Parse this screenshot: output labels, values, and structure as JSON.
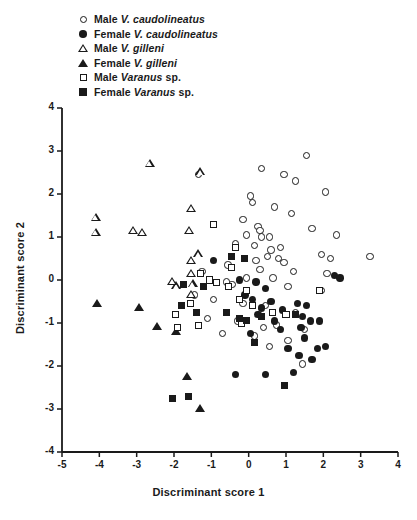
{
  "chart_data": {
    "type": "scatter",
    "title": "",
    "xlabel": "Discriminant score 1",
    "ylabel": "Discriminant score 2",
    "xlim": [
      -5,
      4
    ],
    "ylim": [
      -4,
      4
    ],
    "xticks": [
      "-5",
      "-4",
      "-3",
      "-2",
      "-1",
      "0",
      "1",
      "2",
      "3",
      "4"
    ],
    "xtick_values": [
      -5,
      -4,
      -3,
      -2,
      -1,
      0,
      1,
      2,
      3,
      4
    ],
    "yticks": [
      "4",
      "3",
      "2",
      "1",
      "0",
      "-1",
      "-2",
      "-3",
      "-4"
    ],
    "ytick_values": [
      4,
      3,
      2,
      1,
      0,
      -1,
      -2,
      -3,
      -4
    ],
    "grid": false,
    "legend_position": "top",
    "legend": [
      {
        "marker": "circle-open",
        "label": "Male ",
        "italic": "V. caudolineatus",
        "tail": ""
      },
      {
        "marker": "circle-filled",
        "label": "Female ",
        "italic": "V. caudolineatus",
        "tail": ""
      },
      {
        "marker": "triangle-open",
        "label": "Male ",
        "italic": "V. gilleni",
        "tail": ""
      },
      {
        "marker": "triangle-filled",
        "label": "Female ",
        "italic": "V. gilleni",
        "tail": ""
      },
      {
        "marker": "square-open",
        "label": "Male ",
        "italic": "Varanus",
        "tail": " sp."
      },
      {
        "marker": "square-filled",
        "label": "Female ",
        "italic": "Varanus",
        "tail": " sp."
      }
    ],
    "series": [
      {
        "name": "Male V. caudolineatus",
        "marker": "circle-open",
        "points": [
          [
            -1.35,
            2.45
          ],
          [
            0.35,
            2.6
          ],
          [
            0.95,
            2.45
          ],
          [
            1.55,
            2.9
          ],
          [
            1.25,
            2.3
          ],
          [
            2.05,
            2.05
          ],
          [
            0.05,
            1.95
          ],
          [
            0.1,
            1.8
          ],
          [
            0.7,
            1.7
          ],
          [
            1.15,
            1.55
          ],
          [
            -0.15,
            1.4
          ],
          [
            0.25,
            1.25
          ],
          [
            0.3,
            1.15
          ],
          [
            -0.05,
            1.05
          ],
          [
            0.35,
            1.0
          ],
          [
            0.55,
            1.0
          ],
          [
            1.7,
            1.2
          ],
          [
            2.35,
            1.05
          ],
          [
            -0.35,
            0.85
          ],
          [
            0.15,
            0.8
          ],
          [
            0.6,
            0.7
          ],
          [
            0.85,
            0.75
          ],
          [
            0.5,
            0.55
          ],
          [
            0.8,
            0.5
          ],
          [
            1.95,
            0.6
          ],
          [
            2.2,
            0.5
          ],
          [
            0.2,
            0.45
          ],
          [
            0.95,
            0.4
          ],
          [
            3.25,
            0.55
          ],
          [
            -0.55,
            0.35
          ],
          [
            0.3,
            0.25
          ],
          [
            1.2,
            0.2
          ],
          [
            2.1,
            0.15
          ],
          [
            -1.25,
            0.2
          ],
          [
            -0.05,
            0.05
          ],
          [
            0.65,
            0.05
          ],
          [
            -0.45,
            -0.1
          ],
          [
            1.05,
            -0.15
          ],
          [
            1.95,
            -0.25
          ],
          [
            -1.45,
            -0.35
          ],
          [
            -0.95,
            -0.45
          ],
          [
            -0.15,
            -0.55
          ],
          [
            0.45,
            -0.6
          ],
          [
            1.25,
            -0.75
          ],
          [
            -1.1,
            -0.9
          ],
          [
            -0.3,
            -0.95
          ],
          [
            0.75,
            -1.05
          ],
          [
            1.5,
            -1.15
          ],
          [
            -0.7,
            -1.25
          ],
          [
            0.15,
            -1.3
          ],
          [
            1.05,
            -1.4
          ],
          [
            0.55,
            -1.55
          ],
          [
            1.45,
            -1.95
          ],
          [
            -0.6,
            -0.05
          ],
          [
            0.4,
            -1.1
          ]
        ]
      },
      {
        "name": "Female V. caudolineatus",
        "marker": "circle-filled",
        "points": [
          [
            -0.95,
            0.45
          ],
          [
            2.3,
            0.1
          ],
          [
            -0.25,
            0.0
          ],
          [
            0.2,
            -0.05
          ],
          [
            0.45,
            -0.2
          ],
          [
            -0.1,
            -0.35
          ],
          [
            0.1,
            -0.45
          ],
          [
            0.6,
            -0.5
          ],
          [
            1.3,
            -0.55
          ],
          [
            1.55,
            -0.6
          ],
          [
            0.9,
            -0.7
          ],
          [
            1.45,
            -0.85
          ],
          [
            0.25,
            -0.8
          ],
          [
            0.7,
            -0.95
          ],
          [
            1.65,
            -0.95
          ],
          [
            1.9,
            -0.95
          ],
          [
            1.4,
            -1.1
          ],
          [
            0.05,
            -1.25
          ],
          [
            1.5,
            -1.35
          ],
          [
            1.05,
            -1.6
          ],
          [
            1.85,
            -1.6
          ],
          [
            2.05,
            -1.55
          ],
          [
            1.35,
            -1.75
          ],
          [
            1.7,
            -1.85
          ],
          [
            0.45,
            -2.2
          ],
          [
            1.2,
            -2.15
          ],
          [
            -0.35,
            -2.2
          ],
          [
            0.85,
            -1.15
          ],
          [
            0.35,
            -0.65
          ],
          [
            2.45,
            0.05
          ]
        ]
      },
      {
        "name": "Male V. gilleni",
        "marker": "triangle-open",
        "points": [
          [
            -2.65,
            2.7
          ],
          [
            -1.3,
            2.5
          ],
          [
            -4.1,
            1.45
          ],
          [
            -4.1,
            1.1
          ],
          [
            -3.1,
            1.15
          ],
          [
            -2.85,
            1.1
          ],
          [
            -1.55,
            1.65
          ],
          [
            -1.6,
            1.15
          ],
          [
            -1.55,
            0.45
          ],
          [
            -1.55,
            0.15
          ],
          [
            -1.5,
            -0.1
          ],
          [
            -1.95,
            -0.15
          ],
          [
            -2.05,
            -0.05
          ],
          [
            -1.55,
            -0.35
          ],
          [
            -1.35,
            0.6
          ]
        ]
      },
      {
        "name": "Female V. gilleni",
        "marker": "triangle-filled",
        "points": [
          [
            -4.05,
            -0.55
          ],
          [
            -2.95,
            -0.65
          ],
          [
            -2.45,
            -1.1
          ],
          [
            -1.95,
            -1.2
          ],
          [
            -1.65,
            -2.25
          ],
          [
            -1.3,
            -3.0
          ]
        ]
      },
      {
        "name": "Male Varanus sp.",
        "marker": "square-open",
        "points": [
          [
            -0.95,
            1.3
          ],
          [
            -1.3,
            0.15
          ],
          [
            -0.35,
            0.75
          ],
          [
            -0.45,
            0.3
          ],
          [
            -1.05,
            0.0
          ],
          [
            -0.85,
            -0.05
          ],
          [
            -0.55,
            -0.15
          ],
          [
            -1.55,
            -0.55
          ],
          [
            -1.95,
            -0.8
          ],
          [
            -1.35,
            -1.05
          ],
          [
            -0.25,
            -0.45
          ],
          [
            0.1,
            -0.6
          ],
          [
            0.65,
            -0.75
          ],
          [
            1.0,
            -0.8
          ],
          [
            -0.2,
            -1.0
          ],
          [
            -1.9,
            -1.1
          ],
          [
            1.9,
            -0.25
          ],
          [
            -0.05,
            -0.25
          ]
        ]
      },
      {
        "name": "Female Varanus sp.",
        "marker": "square-filled",
        "points": [
          [
            -0.45,
            0.55
          ],
          [
            -0.1,
            0.5
          ],
          [
            -1.75,
            -0.1
          ],
          [
            -1.2,
            -0.15
          ],
          [
            -1.8,
            -0.6
          ],
          [
            -1.4,
            -0.75
          ],
          [
            -0.6,
            -0.75
          ],
          [
            -0.25,
            -0.9
          ],
          [
            -0.05,
            -0.95
          ],
          [
            0.35,
            -0.85
          ],
          [
            1.25,
            -0.8
          ],
          [
            0.15,
            -1.45
          ],
          [
            0.95,
            -2.45
          ],
          [
            -2.05,
            -2.75
          ],
          [
            -1.6,
            -2.7
          ]
        ]
      }
    ]
  },
  "geometry": {
    "plot_left": 62,
    "plot_right": 398,
    "plot_top": 108,
    "plot_bottom": 452
  }
}
